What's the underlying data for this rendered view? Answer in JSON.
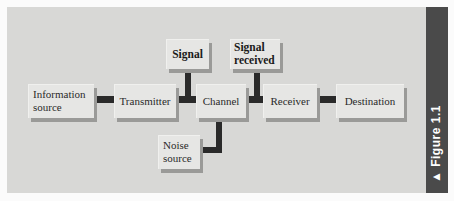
{
  "figure": {
    "label": "▲ Figure 1.1",
    "panel_color": "#d8d8d6",
    "sidebar_color": "#4a4a4a",
    "connector_color": "#2a2a2a"
  },
  "diagram": {
    "nodes": {
      "information_source": "Information source",
      "transmitter": "Transmitter",
      "channel": "Channel",
      "receiver": "Receiver",
      "destination": "Destination",
      "signal": "Signal",
      "signal_received": "Signal received",
      "noise_source": "Noise source"
    },
    "node_lines": {
      "information_source": [
        "Information",
        "source"
      ],
      "signal_received": [
        "Signal",
        "received"
      ],
      "noise_source": [
        "Noise",
        "source"
      ]
    },
    "edges": [
      {
        "from": "Information source",
        "to": "Transmitter"
      },
      {
        "from": "Transmitter",
        "to": "Channel",
        "label": "Signal"
      },
      {
        "from": "Channel",
        "to": "Receiver",
        "label": "Signal received"
      },
      {
        "from": "Receiver",
        "to": "Destination"
      },
      {
        "from": "Noise source",
        "to": "Channel"
      }
    ]
  }
}
